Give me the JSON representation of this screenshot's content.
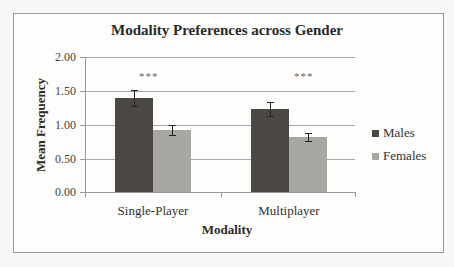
{
  "chart_data": {
    "type": "bar",
    "title": "Modality Preferences across Gender",
    "xlabel": "Modality",
    "ylabel": "Mean Frequency",
    "categories": [
      "Single-Player",
      "Multiplayer"
    ],
    "series": [
      {
        "name": "Males",
        "color": "#4a4744",
        "values": [
          1.39,
          1.23
        ],
        "error": [
          0.12,
          0.11
        ]
      },
      {
        "name": "Females",
        "color": "#a9a7a4",
        "values": [
          0.92,
          0.81
        ],
        "error": [
          0.07,
          0.06
        ]
      }
    ],
    "yticks": [
      "0.00",
      "0.50",
      "1.00",
      "1.50",
      "2.00"
    ],
    "ylim": [
      0,
      2
    ],
    "grid": true,
    "legend_position": "right",
    "annotations": [
      "***",
      "***"
    ]
  }
}
